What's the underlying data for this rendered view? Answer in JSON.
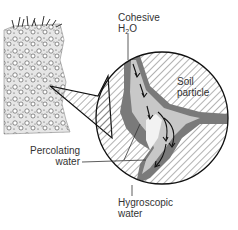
{
  "diagram": {
    "labels": {
      "cohesive_line1": "Cohesive",
      "cohesive_h": "H",
      "cohesive_sub": "2",
      "cohesive_o": "O",
      "soil_particle_line1": "Soil",
      "soil_particle_line2": "particle",
      "percolating_line1": "Percolating",
      "percolating_line2": "water",
      "hygroscopic_line1": "Hygroscopic",
      "hygroscopic_line2": "water"
    },
    "colors": {
      "outline": "#111111",
      "hatch": "#555555",
      "water_film": "#7a7a7a",
      "percolating_water": "#c8c8c8",
      "text": "#333333"
    }
  }
}
